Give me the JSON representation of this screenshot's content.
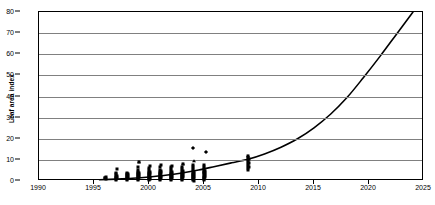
{
  "chart_data": {
    "type": "scatter",
    "title": "",
    "annotation": "N = 15 Cohorts, R² = 0.7356",
    "xlabel": "",
    "ylabel": "Leaf area index",
    "xlim": [
      1990,
      2025
    ],
    "ylim": [
      0,
      80
    ],
    "xticks": [
      1990,
      1995,
      2000,
      2005,
      2010,
      2015,
      2020,
      2025
    ],
    "yticks": [
      0,
      10,
      20,
      30,
      40,
      50,
      60,
      70,
      80
    ],
    "grid": "horizontal",
    "legend": "none",
    "marker_color": "#000000",
    "trend_color": "#000000",
    "gridline_color": "#808080",
    "axis_color": "#000000",
    "background": "#ffffff",
    "series": [
      {
        "name": "Leaf area index observations",
        "marker": "square",
        "points": [
          [
            1996.0,
            1.2
          ],
          [
            1996.0,
            1.6
          ],
          [
            1996.1,
            2.0
          ],
          [
            1996.1,
            0.9
          ],
          [
            1997.0,
            0.6
          ],
          [
            1997.0,
            1.1
          ],
          [
            1997.0,
            1.6
          ],
          [
            1997.0,
            2.1
          ],
          [
            1997.0,
            2.6
          ],
          [
            1997.0,
            3.1
          ],
          [
            1997.0,
            3.6
          ],
          [
            1997.1,
            5.5
          ],
          [
            1997.1,
            1.4
          ],
          [
            1997.1,
            2.4
          ],
          [
            1998.0,
            0.5
          ],
          [
            1998.0,
            1.0
          ],
          [
            1998.0,
            1.5
          ],
          [
            1998.0,
            2.0
          ],
          [
            1998.0,
            2.5
          ],
          [
            1998.0,
            3.0
          ],
          [
            1998.0,
            3.5
          ],
          [
            1998.0,
            4.0
          ],
          [
            1998.1,
            1.2
          ],
          [
            1998.1,
            2.2
          ],
          [
            1998.1,
            3.2
          ],
          [
            1999.0,
            0.4
          ],
          [
            1999.0,
            0.9
          ],
          [
            1999.0,
            1.4
          ],
          [
            1999.0,
            1.9
          ],
          [
            1999.0,
            2.4
          ],
          [
            1999.0,
            2.9
          ],
          [
            1999.0,
            3.4
          ],
          [
            1999.0,
            3.9
          ],
          [
            1999.0,
            4.4
          ],
          [
            1999.0,
            5.4
          ],
          [
            1999.0,
            6.4
          ],
          [
            1999.1,
            8.8
          ],
          [
            1999.1,
            1.7
          ],
          [
            1999.1,
            2.7
          ],
          [
            1999.1,
            3.7
          ],
          [
            2000.0,
            0.4
          ],
          [
            2000.0,
            0.9
          ],
          [
            2000.0,
            1.4
          ],
          [
            2000.0,
            1.9
          ],
          [
            2000.0,
            2.4
          ],
          [
            2000.0,
            2.9
          ],
          [
            2000.0,
            3.4
          ],
          [
            2000.0,
            3.9
          ],
          [
            2000.0,
            4.4
          ],
          [
            2000.0,
            5.2
          ],
          [
            2000.0,
            6.2
          ],
          [
            2000.1,
            7.0
          ],
          [
            2000.1,
            1.1
          ],
          [
            2000.1,
            2.1
          ],
          [
            2000.1,
            3.1
          ],
          [
            2000.1,
            4.1
          ],
          [
            2001.0,
            0.4
          ],
          [
            2001.0,
            0.9
          ],
          [
            2001.0,
            1.4
          ],
          [
            2001.0,
            1.9
          ],
          [
            2001.0,
            2.4
          ],
          [
            2001.0,
            2.9
          ],
          [
            2001.0,
            3.4
          ],
          [
            2001.0,
            3.9
          ],
          [
            2001.0,
            4.4
          ],
          [
            2001.0,
            5.4
          ],
          [
            2001.0,
            6.4
          ],
          [
            2001.1,
            7.4
          ],
          [
            2001.1,
            1.6
          ],
          [
            2001.1,
            2.6
          ],
          [
            2001.1,
            3.6
          ],
          [
            2001.1,
            4.6
          ],
          [
            2002.0,
            0.5
          ],
          [
            2002.0,
            1.0
          ],
          [
            2002.0,
            1.5
          ],
          [
            2002.0,
            2.0
          ],
          [
            2002.0,
            2.5
          ],
          [
            2002.0,
            3.0
          ],
          [
            2002.0,
            3.5
          ],
          [
            2002.0,
            4.0
          ],
          [
            2002.0,
            4.5
          ],
          [
            2002.0,
            5.5
          ],
          [
            2002.0,
            6.5
          ],
          [
            2002.1,
            7.2
          ],
          [
            2002.1,
            1.3
          ],
          [
            2002.1,
            2.3
          ],
          [
            2002.1,
            3.3
          ],
          [
            2002.1,
            4.3
          ],
          [
            2003.0,
            0.5
          ],
          [
            2003.0,
            1.0
          ],
          [
            2003.0,
            1.5
          ],
          [
            2003.0,
            2.0
          ],
          [
            2003.0,
            2.5
          ],
          [
            2003.0,
            3.0
          ],
          [
            2003.0,
            3.5
          ],
          [
            2003.0,
            4.0
          ],
          [
            2003.0,
            4.5
          ],
          [
            2003.0,
            5.5
          ],
          [
            2003.0,
            6.5
          ],
          [
            2003.1,
            8.2
          ],
          [
            2003.1,
            1.8
          ],
          [
            2003.1,
            2.8
          ],
          [
            2003.1,
            3.8
          ],
          [
            2003.1,
            4.8
          ],
          [
            2004.0,
            0.5
          ],
          [
            2004.0,
            1.0
          ],
          [
            2004.0,
            1.5
          ],
          [
            2004.0,
            2.0
          ],
          [
            2004.0,
            2.5
          ],
          [
            2004.0,
            3.0
          ],
          [
            2004.0,
            3.5
          ],
          [
            2004.0,
            4.0
          ],
          [
            2004.0,
            4.5
          ],
          [
            2004.0,
            5.5
          ],
          [
            2004.0,
            6.5
          ],
          [
            2004.0,
            7.5
          ],
          [
            2004.1,
            1.2
          ],
          [
            2004.1,
            2.2
          ],
          [
            2004.1,
            3.2
          ],
          [
            2004.1,
            4.2
          ],
          [
            2004.1,
            0.2
          ],
          [
            2005.0,
            0.6
          ],
          [
            2005.0,
            1.1
          ],
          [
            2005.0,
            1.6
          ],
          [
            2005.0,
            2.1
          ],
          [
            2005.0,
            2.6
          ],
          [
            2005.0,
            3.1
          ],
          [
            2005.0,
            3.6
          ],
          [
            2005.0,
            4.1
          ],
          [
            2005.0,
            4.6
          ],
          [
            2005.0,
            5.6
          ],
          [
            2005.0,
            6.6
          ],
          [
            2005.0,
            7.6
          ],
          [
            2005.1,
            1.9
          ],
          [
            2005.1,
            2.9
          ],
          [
            2005.1,
            3.9
          ],
          [
            2005.1,
            4.9
          ],
          [
            2009.0,
            5.0
          ],
          [
            2009.0,
            6.0
          ],
          [
            2009.0,
            7.0
          ],
          [
            2009.0,
            8.0
          ],
          [
            2009.0,
            9.0
          ],
          [
            2009.0,
            10.0
          ],
          [
            2009.0,
            11.0
          ],
          [
            2009.0,
            12.0
          ],
          [
            2009.1,
            6.5
          ],
          [
            2009.1,
            8.5
          ],
          [
            2009.1,
            10.5
          ]
        ]
      },
      {
        "name": "High outliers",
        "marker": "diamond",
        "points": [
          [
            2004.0,
            15.5
          ],
          [
            2005.2,
            13.5
          ]
        ]
      },
      {
        "name": "Cohort peaks",
        "marker": "triangle",
        "points": [
          [
            1999.1,
            8.8
          ],
          [
            2003.1,
            8.2
          ],
          [
            2004.05,
            9.6
          ],
          [
            2009.0,
            12.0
          ]
        ]
      }
    ],
    "trendline": {
      "name": "Exponential fit",
      "type": "exponential",
      "r_squared": 0.7356,
      "points": [
        [
          1995.5,
          0.6
        ],
        [
          1997.0,
          0.9
        ],
        [
          1998.5,
          1.3
        ],
        [
          2000.0,
          1.9
        ],
        [
          2001.5,
          2.7
        ],
        [
          2003.0,
          3.8
        ],
        [
          2004.5,
          5.2
        ],
        [
          2006.0,
          6.9
        ],
        [
          2007.5,
          8.6
        ],
        [
          2009.0,
          10.3
        ],
        [
          2010.5,
          12.8
        ],
        [
          2012.0,
          16.0
        ],
        [
          2013.5,
          20.0
        ],
        [
          2015.0,
          25.2
        ],
        [
          2016.5,
          31.6
        ],
        [
          2018.0,
          39.5
        ],
        [
          2019.5,
          49.0
        ],
        [
          2021.0,
          59.0
        ],
        [
          2022.5,
          69.5
        ],
        [
          2024.0,
          80.0
        ]
      ]
    }
  }
}
